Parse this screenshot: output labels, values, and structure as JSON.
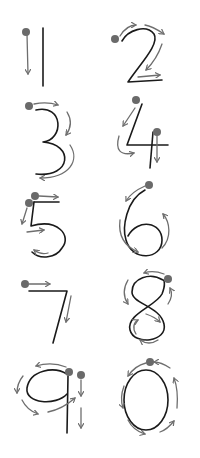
{
  "worksheet": {
    "title": "Number stroke order",
    "colors": {
      "digit": "#1a1a1a",
      "guide_arrow": "#6e6e6e",
      "start_dot": "#6a6a6a",
      "background": "#ffffff"
    },
    "digits": [
      {
        "value": "1",
        "strokes": 1
      },
      {
        "value": "2",
        "strokes": 1
      },
      {
        "value": "3",
        "strokes": 1
      },
      {
        "value": "4",
        "strokes": 2
      },
      {
        "value": "5",
        "strokes": 2
      },
      {
        "value": "6",
        "strokes": 1
      },
      {
        "value": "7",
        "strokes": 1
      },
      {
        "value": "8",
        "strokes": 1
      },
      {
        "value": "9",
        "strokes": 2
      },
      {
        "value": "0",
        "strokes": 1
      }
    ]
  }
}
